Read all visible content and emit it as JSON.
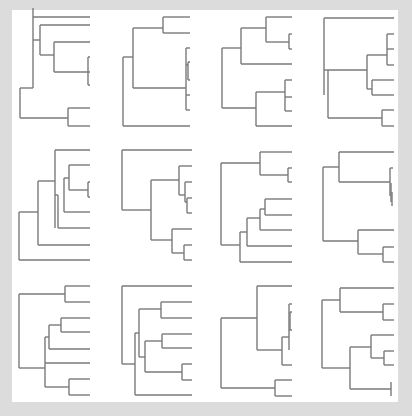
{
  "figure": {
    "title": "",
    "layout": {
      "rows": 3,
      "cols": 4
    },
    "colors": {
      "background": "#dcdcdc",
      "panel": "#ffffff",
      "line": "#7a7a7a"
    }
  },
  "panels": [
    {
      "id": "r1c1",
      "row": 0,
      "col": 0,
      "segments": [
        [
          20,
          88,
          20,
          118
        ],
        [
          20,
          88,
          33,
          88
        ],
        [
          33,
          88,
          33,
          8
        ],
        [
          33,
          17,
          90,
          17
        ],
        [
          33,
          40,
          40,
          40
        ],
        [
          40,
          40,
          40,
          25
        ],
        [
          40,
          25,
          90,
          25
        ],
        [
          40,
          40,
          40,
          55
        ],
        [
          40,
          55,
          54,
          55
        ],
        [
          54,
          42,
          90,
          42
        ],
        [
          54,
          42,
          54,
          72
        ],
        [
          54,
          72,
          88,
          72
        ],
        [
          88,
          57,
          88,
          85
        ],
        [
          88,
          57,
          90,
          57
        ],
        [
          88,
          72,
          90,
          72
        ],
        [
          88,
          85,
          90,
          85
        ],
        [
          20,
          118,
          68,
          118
        ],
        [
          68,
          108,
          68,
          126
        ],
        [
          68,
          108,
          90,
          108
        ],
        [
          68,
          126,
          90,
          126
        ]
      ]
    },
    {
      "id": "r1c2",
      "row": 0,
      "col": 1,
      "segments": [
        [
          123,
          57,
          123,
          126
        ],
        [
          123,
          57,
          133,
          57
        ],
        [
          133,
          28,
          133,
          88
        ],
        [
          133,
          88,
          186,
          88
        ],
        [
          133,
          28,
          163,
          28
        ],
        [
          163,
          17,
          163,
          33
        ],
        [
          163,
          17,
          190,
          17
        ],
        [
          163,
          33,
          190,
          33
        ],
        [
          186,
          48,
          186,
          110
        ],
        [
          186,
          48,
          190,
          48
        ],
        [
          186,
          65,
          188,
          65
        ],
        [
          188,
          62,
          188,
          80
        ],
        [
          188,
          62,
          190,
          62
        ],
        [
          188,
          80,
          190,
          80
        ],
        [
          186,
          95,
          190,
          95
        ],
        [
          186,
          110,
          190,
          110
        ],
        [
          123,
          126,
          190,
          126
        ]
      ]
    },
    {
      "id": "r1c3",
      "row": 0,
      "col": 2,
      "segments": [
        [
          222,
          48,
          222,
          108
        ],
        [
          222,
          48,
          241,
          48
        ],
        [
          241,
          28,
          241,
          64
        ],
        [
          241,
          28,
          266,
          28
        ],
        [
          266,
          17,
          266,
          42
        ],
        [
          266,
          17,
          292,
          17
        ],
        [
          266,
          42,
          289,
          42
        ],
        [
          289,
          34,
          289,
          49
        ],
        [
          289,
          34,
          292,
          34
        ],
        [
          289,
          49,
          292,
          49
        ],
        [
          241,
          64,
          292,
          64
        ],
        [
          222,
          108,
          256,
          108
        ],
        [
          256,
          92,
          256,
          126
        ],
        [
          256,
          92,
          285,
          92
        ],
        [
          285,
          80,
          285,
          111
        ],
        [
          285,
          80,
          292,
          80
        ],
        [
          285,
          97,
          292,
          97
        ],
        [
          285,
          111,
          292,
          111
        ],
        [
          256,
          126,
          292,
          126
        ]
      ]
    },
    {
      "id": "r1c4",
      "row": 0,
      "col": 3,
      "segments": [
        [
          324,
          18,
          324,
          95
        ],
        [
          324,
          18,
          394,
          18
        ],
        [
          324,
          70,
          328,
          70
        ],
        [
          328,
          70,
          328,
          118
        ],
        [
          328,
          70,
          367,
          70
        ],
        [
          367,
          55,
          367,
          89
        ],
        [
          367,
          55,
          387,
          55
        ],
        [
          387,
          34,
          387,
          65
        ],
        [
          387,
          34,
          394,
          34
        ],
        [
          387,
          49,
          394,
          49
        ],
        [
          387,
          65,
          394,
          65
        ],
        [
          367,
          89,
          372,
          89
        ],
        [
          372,
          80,
          372,
          95
        ],
        [
          372,
          80,
          394,
          80
        ],
        [
          372,
          95,
          394,
          95
        ],
        [
          328,
          118,
          382,
          118
        ],
        [
          382,
          110,
          382,
          126
        ],
        [
          382,
          110,
          394,
          110
        ],
        [
          382,
          126,
          394,
          126
        ]
      ]
    },
    {
      "id": "r2c1",
      "row": 1,
      "col": 0,
      "segments": [
        [
          19,
          212,
          19,
          260
        ],
        [
          19,
          212,
          38,
          212
        ],
        [
          38,
          181,
          38,
          245
        ],
        [
          38,
          181,
          55,
          181
        ],
        [
          55,
          150,
          55,
          228
        ],
        [
          55,
          150,
          90,
          150
        ],
        [
          55,
          195,
          58,
          195
        ],
        [
          64,
          178,
          69,
          178
        ],
        [
          69,
          165,
          69,
          190
        ],
        [
          69,
          165,
          90,
          165
        ],
        [
          69,
          190,
          88,
          190
        ],
        [
          88,
          182,
          88,
          197
        ],
        [
          88,
          182,
          90,
          182
        ],
        [
          88,
          197,
          90,
          197
        ],
        [
          64,
          178,
          64,
          212
        ],
        [
          64,
          212,
          90,
          212
        ],
        [
          58,
          195,
          58,
          228
        ],
        [
          58,
          228,
          90,
          228
        ],
        [
          38,
          245,
          90,
          245
        ],
        [
          19,
          260,
          90,
          260
        ]
      ]
    },
    {
      "id": "r2c2",
      "row": 1,
      "col": 1,
      "segments": [
        [
          122,
          150,
          122,
          210
        ],
        [
          122,
          150,
          192,
          150
        ],
        [
          122,
          210,
          151,
          210
        ],
        [
          151,
          180,
          151,
          240
        ],
        [
          151,
          180,
          179,
          180
        ],
        [
          179,
          166,
          179,
          195
        ],
        [
          179,
          166,
          192,
          166
        ],
        [
          179,
          195,
          185,
          195
        ],
        [
          185,
          182,
          185,
          202
        ],
        [
          185,
          182,
          192,
          182
        ],
        [
          185,
          202,
          187,
          202
        ],
        [
          187,
          198,
          187,
          213
        ],
        [
          187,
          198,
          192,
          198
        ],
        [
          187,
          213,
          192,
          213
        ],
        [
          151,
          240,
          172,
          240
        ],
        [
          172,
          229,
          172,
          253
        ],
        [
          172,
          229,
          192,
          229
        ],
        [
          172,
          253,
          184,
          253
        ],
        [
          184,
          245,
          184,
          260
        ],
        [
          184,
          245,
          192,
          245
        ],
        [
          184,
          260,
          192,
          260
        ]
      ]
    },
    {
      "id": "r2c3",
      "row": 1,
      "col": 2,
      "segments": [
        [
          221,
          163,
          221,
          245
        ],
        [
          221,
          163,
          260,
          163
        ],
        [
          260,
          152,
          260,
          175
        ],
        [
          260,
          152,
          292,
          152
        ],
        [
          260,
          175,
          288,
          175
        ],
        [
          288,
          168,
          288,
          182
        ],
        [
          288,
          168,
          292,
          168
        ],
        [
          288,
          182,
          292,
          182
        ],
        [
          221,
          245,
          240,
          245
        ],
        [
          240,
          232,
          240,
          262
        ],
        [
          240,
          232,
          247,
          232
        ],
        [
          247,
          218,
          247,
          246
        ],
        [
          247,
          218,
          260,
          218
        ],
        [
          260,
          209,
          260,
          230
        ],
        [
          260,
          209,
          265,
          209
        ],
        [
          265,
          199,
          265,
          215
        ],
        [
          265,
          199,
          292,
          199
        ],
        [
          265,
          215,
          292,
          215
        ],
        [
          260,
          230,
          292,
          230
        ],
        [
          247,
          246,
          292,
          246
        ],
        [
          240,
          262,
          292,
          262
        ]
      ]
    },
    {
      "id": "r2c4",
      "row": 1,
      "col": 3,
      "segments": [
        [
          323,
          167,
          323,
          241
        ],
        [
          323,
          167,
          339,
          167
        ],
        [
          339,
          152,
          339,
          182
        ],
        [
          339,
          152,
          394,
          152
        ],
        [
          339,
          182,
          390,
          182
        ],
        [
          390,
          168,
          390,
          196
        ],
        [
          390,
          168,
          393,
          168
        ],
        [
          391,
          183,
          391,
          202
        ],
        [
          392,
          192,
          392,
          206
        ],
        [
          323,
          241,
          358,
          241
        ],
        [
          358,
          230,
          358,
          254
        ],
        [
          358,
          230,
          394,
          230
        ],
        [
          358,
          254,
          383,
          254
        ],
        [
          383,
          247,
          383,
          262
        ],
        [
          383,
          247,
          394,
          247
        ],
        [
          383,
          262,
          394,
          262
        ]
      ]
    },
    {
      "id": "r3c1",
      "row": 2,
      "col": 0,
      "segments": [
        [
          19,
          294,
          19,
          368
        ],
        [
          19,
          294,
          65,
          294
        ],
        [
          65,
          286,
          65,
          302
        ],
        [
          65,
          286,
          90,
          286
        ],
        [
          65,
          302,
          90,
          302
        ],
        [
          19,
          368,
          45,
          368
        ],
        [
          45,
          337,
          45,
          387
        ],
        [
          45,
          337,
          49,
          337
        ],
        [
          49,
          325,
          49,
          349
        ],
        [
          49,
          325,
          61,
          325
        ],
        [
          61,
          318,
          61,
          332
        ],
        [
          61,
          318,
          90,
          318
        ],
        [
          61,
          332,
          90,
          332
        ],
        [
          49,
          349,
          90,
          349
        ],
        [
          45,
          363,
          90,
          363
        ],
        [
          45,
          387,
          69,
          387
        ],
        [
          69,
          379,
          69,
          395
        ],
        [
          69,
          379,
          90,
          379
        ],
        [
          69,
          395,
          90,
          395
        ]
      ]
    },
    {
      "id": "r3c2",
      "row": 2,
      "col": 1,
      "segments": [
        [
          122,
          286,
          122,
          364
        ],
        [
          122,
          286,
          192,
          286
        ],
        [
          122,
          364,
          135,
          364
        ],
        [
          135,
          333,
          135,
          395
        ],
        [
          135,
          333,
          139,
          333
        ],
        [
          139,
          309,
          139,
          357
        ],
        [
          139,
          309,
          161,
          309
        ],
        [
          161,
          302,
          161,
          318
        ],
        [
          161,
          302,
          192,
          302
        ],
        [
          161,
          318,
          192,
          318
        ],
        [
          139,
          357,
          145,
          357
        ],
        [
          145,
          341,
          145,
          372
        ],
        [
          145,
          341,
          162,
          341
        ],
        [
          162,
          334,
          162,
          348
        ],
        [
          162,
          334,
          192,
          334
        ],
        [
          162,
          348,
          192,
          348
        ],
        [
          145,
          372,
          182,
          372
        ],
        [
          182,
          364,
          182,
          380
        ],
        [
          182,
          364,
          192,
          364
        ],
        [
          182,
          380,
          192,
          380
        ],
        [
          135,
          395,
          192,
          395
        ]
      ]
    },
    {
      "id": "r3c3",
      "row": 2,
      "col": 2,
      "segments": [
        [
          221,
          318,
          221,
          388
        ],
        [
          221,
          318,
          257,
          318
        ],
        [
          257,
          286,
          257,
          350
        ],
        [
          257,
          286,
          292,
          286
        ],
        [
          257,
          350,
          282,
          350
        ],
        [
          282,
          337,
          282,
          365
        ],
        [
          282,
          337,
          289,
          337
        ],
        [
          289,
          304,
          289,
          350
        ],
        [
          289,
          304,
          292,
          304
        ],
        [
          290,
          312,
          292,
          312
        ],
        [
          290,
          312,
          290,
          330
        ],
        [
          289,
          330,
          292,
          330
        ],
        [
          282,
          365,
          292,
          365
        ],
        [
          221,
          388,
          275,
          388
        ],
        [
          275,
          380,
          275,
          396
        ],
        [
          275,
          380,
          292,
          380
        ],
        [
          275,
          396,
          292,
          396
        ]
      ]
    },
    {
      "id": "r3c4",
      "row": 2,
      "col": 3,
      "segments": [
        [
          322,
          300,
          322,
          368
        ],
        [
          322,
          300,
          340,
          300
        ],
        [
          340,
          288,
          340,
          312
        ],
        [
          340,
          288,
          394,
          288
        ],
        [
          340,
          312,
          383,
          312
        ],
        [
          383,
          304,
          383,
          320
        ],
        [
          383,
          304,
          394,
          304
        ],
        [
          383,
          320,
          394,
          320
        ],
        [
          322,
          368,
          350,
          368
        ],
        [
          350,
          347,
          350,
          389
        ],
        [
          350,
          347,
          371,
          347
        ],
        [
          371,
          335,
          371,
          358
        ],
        [
          371,
          335,
          394,
          335
        ],
        [
          371,
          358,
          384,
          358
        ],
        [
          384,
          351,
          384,
          365
        ],
        [
          384,
          351,
          394,
          351
        ],
        [
          384,
          365,
          394,
          365
        ],
        [
          350,
          389,
          391,
          389
        ],
        [
          391,
          382,
          391,
          396
        ]
      ]
    }
  ]
}
